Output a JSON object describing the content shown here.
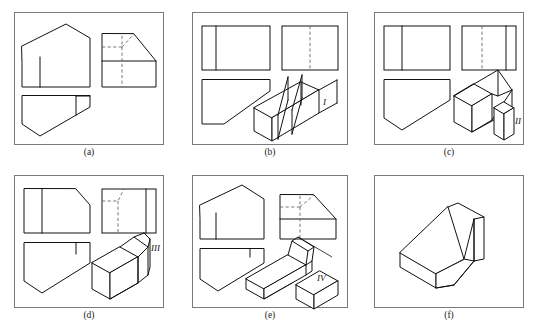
{
  "figure": {
    "panel_count": 6,
    "line_color": "#111111",
    "hidden_line_color": "#666666",
    "frame_color": "#7a7a7a",
    "background": "#ffffff"
  },
  "panels": [
    {
      "id": "a",
      "caption": "(a)",
      "x": 14,
      "y": 12,
      "w": 150,
      "h": 133,
      "views": [
        "front-view",
        "side-view",
        "top-view"
      ],
      "has_hidden_lines": true,
      "part_label": ""
    },
    {
      "id": "b",
      "caption": "(b)",
      "x": 192,
      "y": 12,
      "w": 156,
      "h": 133,
      "views": [
        "front-view",
        "side-view",
        "top-view",
        "pictorial"
      ],
      "has_hidden_lines": true,
      "part_label": "I"
    },
    {
      "id": "c",
      "caption": "(c)",
      "x": 374,
      "y": 12,
      "w": 150,
      "h": 133,
      "views": [
        "front-view",
        "side-view",
        "top-view",
        "pictorial"
      ],
      "has_hidden_lines": true,
      "part_label": "II"
    },
    {
      "id": "d",
      "caption": "(d)",
      "x": 14,
      "y": 175,
      "w": 150,
      "h": 133,
      "views": [
        "front-view",
        "side-view",
        "top-view",
        "pictorial"
      ],
      "has_hidden_lines": true,
      "part_label": "III"
    },
    {
      "id": "e",
      "caption": "(e)",
      "x": 192,
      "y": 175,
      "w": 156,
      "h": 133,
      "views": [
        "front-view",
        "side-view",
        "top-view",
        "pictorial"
      ],
      "has_hidden_lines": true,
      "part_label": "IV"
    },
    {
      "id": "f",
      "caption": "(f)",
      "x": 374,
      "y": 175,
      "w": 150,
      "h": 133,
      "views": [
        "pictorial"
      ],
      "has_hidden_lines": false,
      "part_label": ""
    }
  ],
  "labels": {
    "part_1": "I",
    "part_2": "II",
    "part_3": "III",
    "part_4": "IV"
  },
  "captions": {
    "a": "(a)",
    "b": "(b)",
    "c": "(c)",
    "d": "(d)",
    "e": "(e)",
    "f": "(f)"
  }
}
